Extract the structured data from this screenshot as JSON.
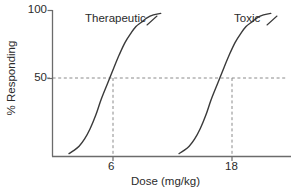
{
  "chart_data": {
    "type": "line",
    "title": "",
    "xlabel": "Dose (mg/kg)",
    "ylabel": "% Responding",
    "xlim": [
      0,
      26
    ],
    "ylim": [
      0,
      100
    ],
    "grid": false,
    "legend": "inline-annotations",
    "xticks": [
      "6",
      "18"
    ],
    "xtick_values": [
      6,
      18
    ],
    "yticks": [
      "100",
      "50"
    ],
    "ytick_values": [
      100,
      50
    ],
    "annotations": [
      {
        "text": "Therapeutic",
        "series": "Therapeutic"
      },
      {
        "text": "Toxic",
        "series": "Toxic"
      }
    ],
    "reference_lines": [
      {
        "orientation": "horizontal",
        "value": 50,
        "style": "dashed"
      },
      {
        "orientation": "vertical",
        "value": 6,
        "style": "dashed"
      },
      {
        "orientation": "vertical",
        "value": 18,
        "style": "dashed"
      }
    ],
    "series": [
      {
        "name": "Therapeutic",
        "ed50": 6,
        "color": "#3a3a3a",
        "x": [
          1.8,
          2.3,
          2.9,
          3.5,
          4.1,
          4.7,
          5.3,
          6.0,
          6.7,
          7.3,
          7.9,
          8.5,
          9.1,
          9.7,
          10.3,
          11.0,
          11.8
        ],
        "y": [
          2,
          4,
          7,
          12,
          19,
          28,
          39,
          50,
          61,
          70,
          78,
          84,
          89,
          92,
          95,
          97,
          98
        ]
      },
      {
        "name": "Toxic",
        "ed50": 18,
        "color": "#3a3a3a",
        "x": [
          13.8,
          14.3,
          14.9,
          15.5,
          16.1,
          16.7,
          17.3,
          18.0,
          18.7,
          19.3,
          19.9,
          20.5,
          21.1,
          21.7,
          22.3,
          23.0,
          23.8
        ],
        "y": [
          2,
          4,
          7,
          12,
          19,
          28,
          39,
          50,
          61,
          70,
          78,
          84,
          89,
          92,
          95,
          97,
          98
        ]
      }
    ]
  },
  "axes": {
    "ylabel": "% Responding",
    "xlabel": "Dose (mg/kg)",
    "ytick_100": "100",
    "ytick_50": "50",
    "xtick_6": "6",
    "xtick_18": "18"
  },
  "annotations": {
    "therapeutic": "Therapeutic",
    "toxic": "Toxic"
  },
  "colors": {
    "curve": "#3a3a3a",
    "axis": "#6b6b6b",
    "dashed": "#8a8a8a",
    "text": "#2b2b2b",
    "background": "#ffffff"
  }
}
